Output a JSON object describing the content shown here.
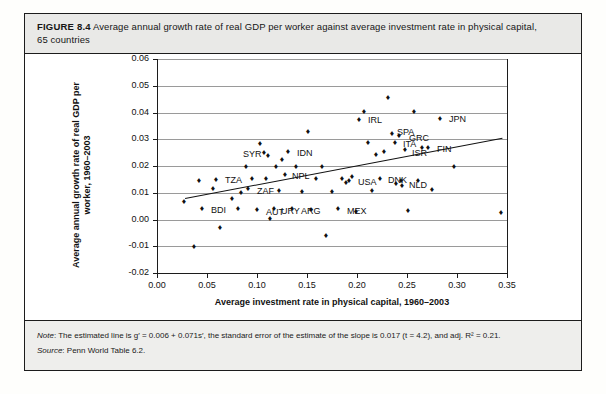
{
  "figure": {
    "number_label": "FIGURE 8.4",
    "caption_line1": "Average annual growth rate of real GDP per worker against average investment rate in physical capital,",
    "caption_line2": "65 countries",
    "note_prefix": "Note",
    "note_text": ": The estimated line is g′ = 0.006 + 0.071s′, the standard error of the estimate of the slope is 0.017 (t = 4.2), and adj. R² = 0.21.",
    "source_prefix": "Source",
    "source_text": ": Penn World Table 6.2."
  },
  "chart_data": {
    "type": "scatter",
    "title": "",
    "xlabel": "Average investment rate in physical capital, 1960–2003",
    "ylabel": "Average annual growth rate of real GDP per worker, 1960–2003",
    "xlim": [
      0.0,
      0.35
    ],
    "ylim": [
      -0.02,
      0.06
    ],
    "xticks": [
      "0.00",
      "0.05",
      "0.10",
      "0.15",
      "0.20",
      "0.25",
      "0.30",
      "0.35"
    ],
    "xtick_values": [
      0.0,
      0.05,
      0.1,
      0.15,
      0.2,
      0.25,
      0.3,
      0.35
    ],
    "yticks": [
      "0.06",
      "0.05",
      "0.04",
      "0.03",
      "0.02",
      "0.01",
      "0.00",
      "-0.01",
      "-0.02"
    ],
    "ytick_values": [
      0.06,
      0.05,
      0.04,
      0.03,
      0.02,
      0.01,
      0.0,
      -0.01,
      -0.02
    ],
    "grid": true,
    "legend": "none",
    "fit_line": {
      "intercept": 0.006,
      "slope": 0.071,
      "x_start": 0.028,
      "x_end": 0.345,
      "label": "g′ = 0.006 + 0.071s′"
    },
    "points": [
      {
        "x": 0.028,
        "y": 0.0063,
        "label": ""
      },
      {
        "x": 0.038,
        "y": -0.0105,
        "label": ""
      },
      {
        "x": 0.043,
        "y": 0.0145,
        "label": ""
      },
      {
        "x": 0.046,
        "y": 0.004,
        "label": "BDI",
        "lx": 8,
        "ly": 2
      },
      {
        "x": 0.057,
        "y": 0.0115,
        "label": ""
      },
      {
        "x": 0.06,
        "y": 0.0148,
        "label": "TZA",
        "lx": 8,
        "ly": 1
      },
      {
        "x": 0.064,
        "y": -0.0033,
        "label": ""
      },
      {
        "x": 0.076,
        "y": 0.0075,
        "label": ""
      },
      {
        "x": 0.082,
        "y": 0.004,
        "label": ""
      },
      {
        "x": 0.085,
        "y": 0.0097,
        "label": ""
      },
      {
        "x": 0.09,
        "y": 0.0195,
        "label": ""
      },
      {
        "x": 0.092,
        "y": 0.0112,
        "label": "ZAF",
        "lx": 8,
        "ly": 2
      },
      {
        "x": 0.096,
        "y": 0.015,
        "label": ""
      },
      {
        "x": 0.101,
        "y": 0.0035,
        "label": "AUT",
        "lx": 8,
        "ly": 3
      },
      {
        "x": 0.104,
        "y": 0.0283,
        "label": ""
      },
      {
        "x": 0.108,
        "y": 0.0248,
        "label": "SYR",
        "lx": -22,
        "ly": 2
      },
      {
        "x": 0.11,
        "y": 0.015,
        "label": ""
      },
      {
        "x": 0.112,
        "y": 0.0238,
        "label": ""
      },
      {
        "x": 0.114,
        "y": 0.0002,
        "label": ""
      },
      {
        "x": 0.118,
        "y": 0.0038,
        "label": "URY",
        "lx": 6,
        "ly": 3
      },
      {
        "x": 0.12,
        "y": 0.0195,
        "label": ""
      },
      {
        "x": 0.123,
        "y": 0.0105,
        "label": ""
      },
      {
        "x": 0.126,
        "y": 0.0222,
        "label": ""
      },
      {
        "x": 0.129,
        "y": 0.0165,
        "label": "NPL",
        "lx": 6,
        "ly": 2
      },
      {
        "x": 0.132,
        "y": 0.025,
        "label": "IDN",
        "lx": 8,
        "ly": 1
      },
      {
        "x": 0.136,
        "y": 0.0038,
        "label": "ARG",
        "lx": 8,
        "ly": 3
      },
      {
        "x": 0.14,
        "y": 0.0195,
        "label": ""
      },
      {
        "x": 0.146,
        "y": 0.0103,
        "label": ""
      },
      {
        "x": 0.152,
        "y": 0.0325,
        "label": ""
      },
      {
        "x": 0.155,
        "y": 0.0035,
        "label": ""
      },
      {
        "x": 0.16,
        "y": 0.015,
        "label": ""
      },
      {
        "x": 0.166,
        "y": 0.0197,
        "label": ""
      },
      {
        "x": 0.17,
        "y": -0.0063,
        "label": ""
      },
      {
        "x": 0.176,
        "y": 0.0103,
        "label": ""
      },
      {
        "x": 0.182,
        "y": 0.004,
        "label": "MEX",
        "lx": 8,
        "ly": 3
      },
      {
        "x": 0.186,
        "y": 0.0152,
        "label": ""
      },
      {
        "x": 0.19,
        "y": 0.0135,
        "label": ""
      },
      {
        "x": 0.193,
        "y": 0.0145,
        "label": "USA",
        "lx": 8,
        "ly": 2
      },
      {
        "x": 0.196,
        "y": 0.016,
        "label": ""
      },
      {
        "x": 0.2,
        "y": 0.0028,
        "label": ""
      },
      {
        "x": 0.203,
        "y": 0.0372,
        "label": "IRL",
        "lx": 8,
        "ly": 1
      },
      {
        "x": 0.208,
        "y": 0.04,
        "label": ""
      },
      {
        "x": 0.212,
        "y": 0.0287,
        "label": ""
      },
      {
        "x": 0.216,
        "y": 0.0105,
        "label": ""
      },
      {
        "x": 0.22,
        "y": 0.0242,
        "label": ""
      },
      {
        "x": 0.224,
        "y": 0.0152,
        "label": "DNK",
        "lx": 7,
        "ly": 2
      },
      {
        "x": 0.228,
        "y": 0.025,
        "label": ""
      },
      {
        "x": 0.232,
        "y": 0.0453,
        "label": ""
      },
      {
        "x": 0.236,
        "y": 0.0318,
        "label": "SPA",
        "lx": 4,
        "ly": -1
      },
      {
        "x": 0.239,
        "y": 0.0285,
        "label": "ITA",
        "lx": 7,
        "ly": 2
      },
      {
        "x": 0.24,
        "y": 0.0133,
        "label": ""
      },
      {
        "x": 0.243,
        "y": 0.031,
        "label": "GRC",
        "lx": 9,
        "ly": 2
      },
      {
        "x": 0.245,
        "y": 0.0142,
        "label": "NLD",
        "lx": 7,
        "ly": 4
      },
      {
        "x": 0.246,
        "y": 0.0125,
        "label": ""
      },
      {
        "x": 0.249,
        "y": 0.0258,
        "label": "ISR",
        "lx": 6,
        "ly": 4
      },
      {
        "x": 0.252,
        "y": 0.003,
        "label": ""
      },
      {
        "x": 0.258,
        "y": 0.04,
        "label": ""
      },
      {
        "x": 0.262,
        "y": 0.0143,
        "label": ""
      },
      {
        "x": 0.266,
        "y": 0.0268,
        "label": ""
      },
      {
        "x": 0.272,
        "y": 0.0268,
        "label": "FIN",
        "lx": 8,
        "ly": 2
      },
      {
        "x": 0.276,
        "y": 0.011,
        "label": ""
      },
      {
        "x": 0.284,
        "y": 0.0375,
        "label": "JPN",
        "lx": 8,
        "ly": 1
      },
      {
        "x": 0.298,
        "y": 0.0195,
        "label": ""
      },
      {
        "x": 0.345,
        "y": 0.0025,
        "label": ""
      }
    ]
  }
}
